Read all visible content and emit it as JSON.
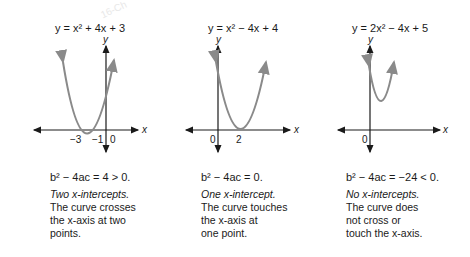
{
  "watermark": "16-Ch",
  "panels": [
    {
      "equation": "y = x² + 4x + 3",
      "y_axis_label": "y",
      "x_axis_label": "x",
      "tick_labels": [
        "−3",
        "−1",
        "0"
      ],
      "discriminant": "b² − 4ac = 4 > 0.",
      "lead": "Two x-intercepts.",
      "description_lines": [
        "The curve crosses",
        "the x-axis at two",
        "points."
      ]
    },
    {
      "equation": "y = x² − 4x + 4",
      "y_axis_label": "y",
      "x_axis_label": "x",
      "tick_labels": [
        "0",
        "2"
      ],
      "discriminant": "b² − 4ac = 0.",
      "lead": "One x-intercept.",
      "description_lines": [
        "The curve touches",
        "the x-axis at",
        "one point."
      ]
    },
    {
      "equation": "y = 2x² − 4x + 5",
      "y_axis_label": "y",
      "x_axis_label": "x",
      "tick_labels": [
        "0"
      ],
      "discriminant": "b² − 4ac = −24 < 0.",
      "lead": "No x-intercepts.",
      "description_lines": [
        "The curve does",
        "not cross or",
        "touch the x-axis."
      ]
    }
  ],
  "colors": {
    "curve": "#8a8a8a",
    "axis": "#1a1a1a",
    "text": "#1a1a1a"
  }
}
